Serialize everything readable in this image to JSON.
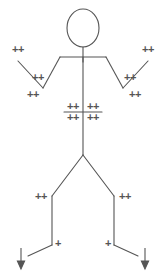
{
  "figure": {
    "background_color": "#ffffff",
    "stroke_color": "#555555",
    "marker_color": "#555555",
    "canvas": {
      "width": 166,
      "height": 278
    },
    "body": {
      "head": {
        "cx": 83,
        "cy": 28,
        "rx": 16,
        "ry": 19
      },
      "neck": {
        "x1": 83,
        "y1": 47,
        "x2": 83,
        "y2": 62
      },
      "shoulders": {
        "x1": 60,
        "y1": 57,
        "x2": 106,
        "y2": 57
      },
      "left_upper_arm": {
        "x1": 60,
        "y1": 57,
        "x2": 43,
        "y2": 88
      },
      "left_forearm": {
        "x1": 43,
        "y1": 88,
        "x2": 18,
        "y2": 61
      },
      "right_upper_arm": {
        "x1": 106,
        "y1": 57,
        "x2": 123,
        "y2": 88
      },
      "right_forearm": {
        "x1": 123,
        "y1": 88,
        "x2": 148,
        "y2": 61
      },
      "torso": {
        "x1": 83,
        "y1": 57,
        "x2": 83,
        "y2": 155
      },
      "waist_bar": {
        "x1": 64,
        "y1": 112,
        "x2": 102,
        "y2": 112
      },
      "left_thigh": {
        "x1": 83,
        "y1": 155,
        "x2": 52,
        "y2": 196
      },
      "left_shin": {
        "x1": 52,
        "y1": 196,
        "x2": 52,
        "y2": 245
      },
      "left_foot": {
        "x1": 52,
        "y1": 245,
        "x2": 28,
        "y2": 256
      },
      "right_thigh": {
        "x1": 83,
        "y1": 155,
        "x2": 114,
        "y2": 196
      },
      "right_shin": {
        "x1": 114,
        "y1": 196,
        "x2": 114,
        "y2": 245
      },
      "right_foot": {
        "x1": 114,
        "y1": 245,
        "x2": 138,
        "y2": 256
      }
    },
    "arrows": [
      {
        "name": "left-foot-down-arrow",
        "x": 21,
        "y_start": 248,
        "y_end": 268
      },
      {
        "name": "right-foot-down-arrow",
        "x": 145,
        "y_start": 248,
        "y_end": 268
      }
    ],
    "markers": [
      {
        "name": "marker-left-hand",
        "label": "++",
        "x": 18,
        "y": 49
      },
      {
        "name": "marker-left-forearm",
        "label": "++",
        "x": 38,
        "y": 77
      },
      {
        "name": "marker-left-elbow",
        "label": "++",
        "x": 33,
        "y": 94
      },
      {
        "name": "marker-right-hand",
        "label": "++",
        "x": 148,
        "y": 49
      },
      {
        "name": "marker-right-forearm",
        "label": "++",
        "x": 130,
        "y": 77
      },
      {
        "name": "marker-right-elbow",
        "label": "++",
        "x": 135,
        "y": 94
      },
      {
        "name": "marker-abdomen-upper-left",
        "label": "++",
        "x": 73,
        "y": 106
      },
      {
        "name": "marker-abdomen-upper-right",
        "label": "++",
        "x": 93,
        "y": 106
      },
      {
        "name": "marker-abdomen-lower-left",
        "label": "++",
        "x": 73,
        "y": 117
      },
      {
        "name": "marker-abdomen-lower-right",
        "label": "++",
        "x": 93,
        "y": 117
      },
      {
        "name": "marker-left-knee",
        "label": "++",
        "x": 41,
        "y": 196
      },
      {
        "name": "marker-right-knee",
        "label": "++",
        "x": 125,
        "y": 196
      },
      {
        "name": "marker-left-ankle",
        "label": "+",
        "x": 58,
        "y": 243
      },
      {
        "name": "marker-right-ankle",
        "label": "+",
        "x": 108,
        "y": 243
      }
    ]
  }
}
